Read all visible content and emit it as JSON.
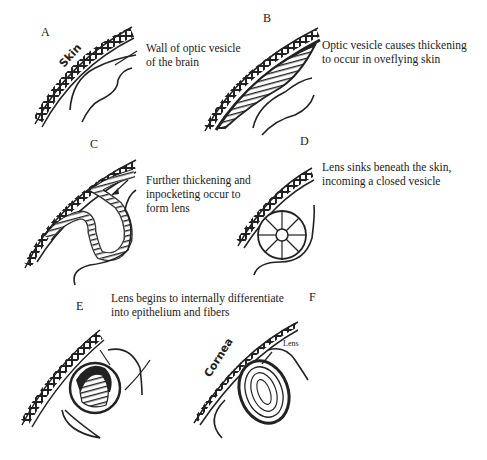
{
  "figure": {
    "panels": [
      {
        "id": "A",
        "letter": "A",
        "caption_lines": [
          "Wall of optic vesicle",
          "of the brain"
        ],
        "inline_labels": [
          "Skin"
        ]
      },
      {
        "id": "B",
        "letter": "B",
        "caption_lines": [
          "Optic vesicle causes thickening",
          "to occur in oveflying skin"
        ],
        "inline_labels": []
      },
      {
        "id": "C",
        "letter": "C",
        "caption_lines": [
          "Further thickening and",
          "inpocketing occur to",
          "form lens"
        ],
        "inline_labels": []
      },
      {
        "id": "D",
        "letter": "D",
        "caption_lines": [
          "Lens sinks beneath the skin,",
          "incoming a closed vesicle"
        ],
        "inline_labels": []
      },
      {
        "id": "E",
        "letter": "E",
        "caption_lines": [
          "Lens begins to internally differentiate",
          "into epithelium and fibers"
        ],
        "inline_labels": []
      },
      {
        "id": "F",
        "letter": "F",
        "caption_lines": [],
        "inline_labels": [
          "Cornea",
          "Lens"
        ]
      }
    ]
  }
}
